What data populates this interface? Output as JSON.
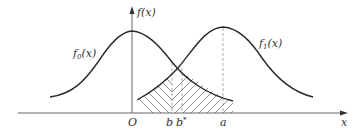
{
  "diagram": {
    "type": "two overlapping probability density curves with hatched error regions",
    "axes": {
      "x_label": "x",
      "y_label": "f(x)",
      "origin_label": "O"
    },
    "curves": [
      {
        "name": "f0",
        "label_base": "f",
        "label_sub": "0",
        "label_arg": "(x)",
        "center": "O"
      },
      {
        "name": "f1",
        "label_base": "f",
        "label_sub": "1",
        "label_arg": "(x)",
        "center": "a"
      }
    ],
    "x_ticks": [
      {
        "id": "b",
        "label": "b"
      },
      {
        "id": "bstar",
        "label": "b",
        "sup": "*"
      },
      {
        "id": "a",
        "label": "a"
      }
    ],
    "hatched_regions": [
      {
        "name": "left-region",
        "description": "area under f1 left of b (hatched)"
      },
      {
        "name": "right-region",
        "description": "area under f0 right of b (hatched)"
      }
    ],
    "colors": {
      "line": "#2a2a2a",
      "axis": "#555555",
      "dashed": "#888888",
      "hatch": "#444444",
      "text": "#333333"
    }
  }
}
